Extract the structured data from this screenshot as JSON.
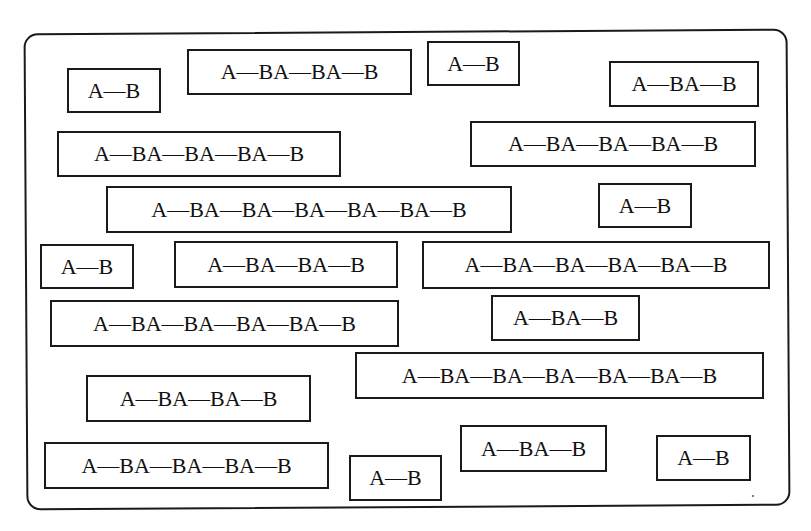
{
  "diagram": {
    "colors": {
      "ink": "#1a1a1a",
      "background": "#ffffff"
    },
    "boxes": [
      {
        "label": "A—B",
        "x": 67,
        "y": 68,
        "w": 94,
        "h": 45
      },
      {
        "label": "A—BA—BA—B",
        "x": 187,
        "y": 49,
        "w": 225,
        "h": 46
      },
      {
        "label": "A—B",
        "x": 427,
        "y": 41,
        "w": 93,
        "h": 45
      },
      {
        "label": "A—BA—B",
        "x": 609,
        "y": 61,
        "w": 150,
        "h": 46
      },
      {
        "label": "A—BA—BA—BA—B",
        "x": 57,
        "y": 131,
        "w": 284,
        "h": 46
      },
      {
        "label": "A—BA—BA—BA—B",
        "x": 470,
        "y": 121,
        "w": 286,
        "h": 46
      },
      {
        "label": "A—BA—BA—BA—BA—BA—B",
        "x": 106,
        "y": 186,
        "w": 406,
        "h": 47
      },
      {
        "label": "A—B",
        "x": 598,
        "y": 183,
        "w": 94,
        "h": 45
      },
      {
        "label": "A—B",
        "x": 40,
        "y": 244,
        "w": 94,
        "h": 45
      },
      {
        "label": "A—BA—BA—B",
        "x": 174,
        "y": 241,
        "w": 224,
        "h": 47
      },
      {
        "label": "A—BA—BA—BA—BA—B",
        "x": 422,
        "y": 241,
        "w": 348,
        "h": 48
      },
      {
        "label": "A—BA—BA—BA—BA—B",
        "x": 50,
        "y": 300,
        "w": 349,
        "h": 47
      },
      {
        "label": "A—BA—B",
        "x": 491,
        "y": 295,
        "w": 149,
        "h": 46
      },
      {
        "label": "A—BA—BA—BA—BA—BA—B",
        "x": 355,
        "y": 352,
        "w": 409,
        "h": 47
      },
      {
        "label": "A—BA—BA—B",
        "x": 86,
        "y": 375,
        "w": 225,
        "h": 47
      },
      {
        "label": "A—BA—BA—BA—B",
        "x": 44,
        "y": 442,
        "w": 285,
        "h": 47
      },
      {
        "label": "A—B",
        "x": 349,
        "y": 455,
        "w": 93,
        "h": 46
      },
      {
        "label": "A—BA—B",
        "x": 460,
        "y": 425,
        "w": 147,
        "h": 47
      },
      {
        "label": "A—B",
        "x": 656,
        "y": 435,
        "w": 95,
        "h": 46
      }
    ]
  }
}
